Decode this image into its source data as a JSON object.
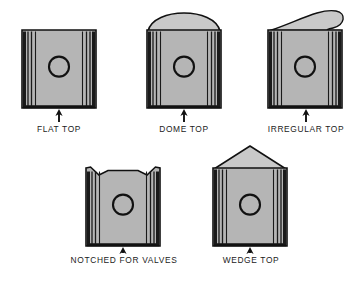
{
  "figure": {
    "background_color": "#ffffff",
    "body_fill": "#b5b5b5",
    "body_fill_light": "#c9c9c9",
    "outline_color": "#111111",
    "groove_color": "#1a1a1a",
    "label_color": "#1b1b1b"
  },
  "pistons": [
    {
      "id": "flat-top",
      "label": "FLAT TOP",
      "crown": "flat",
      "x": 22,
      "y": 30,
      "w": 74,
      "h": 78,
      "label_x": 20,
      "label_y": 124,
      "label_w": 78,
      "arrow_x": 59,
      "arrow_top": 109,
      "arrow_bottom": 122
    },
    {
      "id": "dome-top",
      "label": "DOME TOP",
      "crown": "dome",
      "x": 147,
      "y": 30,
      "w": 74,
      "h": 78,
      "label_x": 144,
      "label_y": 124,
      "label_w": 80,
      "arrow_x": 184,
      "arrow_top": 109,
      "arrow_bottom": 122
    },
    {
      "id": "irregular-top",
      "label": "IRREGULAR TOP",
      "crown": "irregular",
      "x": 268,
      "y": 30,
      "w": 74,
      "h": 78,
      "label_x": 258,
      "label_y": 124,
      "label_w": 96,
      "arrow_x": 306,
      "arrow_top": 109,
      "arrow_bottom": 122
    },
    {
      "id": "notched-for-valves",
      "label": "NOTCHED FOR VALVES",
      "crown": "notched",
      "x": 86,
      "y": 168,
      "w": 74,
      "h": 78,
      "label_x": 60,
      "label_y": 255,
      "label_w": 128,
      "arrow_x": 123,
      "arrow_top": 247,
      "arrow_bottom": 253
    },
    {
      "id": "wedge-top",
      "label": "WEDGE TOP",
      "crown": "wedge",
      "x": 213,
      "y": 168,
      "w": 74,
      "h": 78,
      "label_x": 206,
      "label_y": 255,
      "label_w": 90,
      "arrow_x": 250,
      "arrow_top": 247,
      "arrow_bottom": 253
    }
  ],
  "annotations": {
    "pin_bore_shape": "circle",
    "ring_grooves_per_side": 3
  }
}
